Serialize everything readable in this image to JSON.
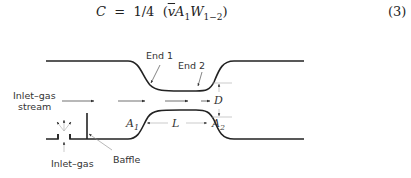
{
  "equation": {
    "lhs": "C",
    "equals": "=",
    "fraction": "1/4",
    "open": "(",
    "vbar": "v",
    "A": "A",
    "A_sub": "1",
    "W": "W",
    "W_sub": "1−2",
    "close": ")",
    "number": "(3)"
  },
  "diagram": {
    "labels": {
      "end1": "End 1",
      "end2": "End 2",
      "inlet_stream_line1": "Inlet–gas",
      "inlet_stream_line2": "stream",
      "inlet_gas": "Inlet–gas",
      "baffle": "Baffle",
      "D": "D",
      "L": "L",
      "A1": "A",
      "A1_sub": "1",
      "A2": "A",
      "A2_sub": "2"
    },
    "colors": {
      "wall": "#222222",
      "leader": "#888888",
      "text": "#333333"
    }
  }
}
